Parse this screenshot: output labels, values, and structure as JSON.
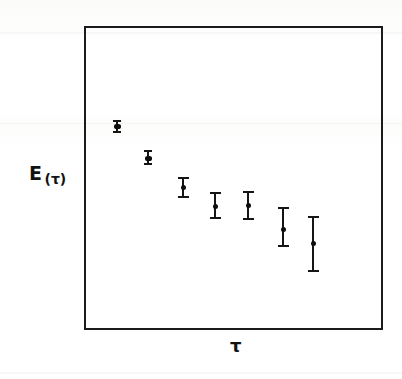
{
  "figure": {
    "background_color": "#ffffff",
    "ink_color": "#151515",
    "frame": {
      "x": 84,
      "y": 26,
      "width": 299,
      "height": 304,
      "border_width": 2
    }
  },
  "axes": {
    "y_label_main": "E",
    "y_label_sub": "(τ)",
    "x_label": "τ",
    "ticks_visible": false,
    "tick_labels": [],
    "grid": false
  },
  "chart_data": {
    "type": "scatter",
    "title": "",
    "subtitle": "",
    "xlabel": "τ",
    "ylabel": "E(τ)",
    "xlim": [
      0,
      1
    ],
    "ylim": [
      0,
      1
    ],
    "grid": false,
    "legend": null,
    "axis_tick_labels": {
      "x": [],
      "y": []
    },
    "series": [
      {
        "name": "E(τ)",
        "marker": "filled-circle",
        "error_bar": "vertical-with-caps",
        "points": [
          {
            "index": 1,
            "px_x": 117,
            "px_y": 126,
            "px_err_top": 120,
            "px_err_bottom": 133,
            "x": 0.111,
            "y": 0.671,
            "yerr": 0.021
          },
          {
            "index": 2,
            "px_x": 148,
            "px_y": 158,
            "px_err_top": 150,
            "px_err_bottom": 165,
            "x": 0.215,
            "y": 0.566,
            "yerr": 0.025
          },
          {
            "index": 3,
            "px_x": 183,
            "px_y": 187,
            "px_err_top": 177,
            "px_err_bottom": 198,
            "x": 0.332,
            "y": 0.47,
            "yerr": 0.035
          },
          {
            "index": 4,
            "px_x": 215,
            "px_y": 206,
            "px_err_top": 192,
            "px_err_bottom": 219,
            "x": 0.439,
            "y": 0.408,
            "yerr": 0.044
          },
          {
            "index": 5,
            "px_x": 248,
            "px_y": 205,
            "px_err_top": 191,
            "px_err_bottom": 220,
            "x": 0.548,
            "y": 0.411,
            "yerr": 0.048
          },
          {
            "index": 6,
            "px_x": 283,
            "px_y": 229,
            "px_err_top": 207,
            "px_err_bottom": 247,
            "x": 0.666,
            "y": 0.332,
            "yerr": 0.066
          },
          {
            "index": 7,
            "px_x": 313,
            "px_y": 243,
            "px_err_top": 216,
            "px_err_bottom": 272,
            "x": 0.766,
            "y": 0.286,
            "yerr": 0.092
          }
        ]
      }
    ]
  }
}
